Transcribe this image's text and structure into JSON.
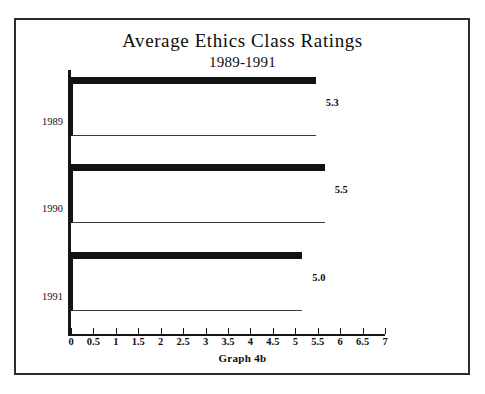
{
  "chart_data": {
    "type": "bar",
    "orientation": "horizontal",
    "title": "Average Ethics Class Ratings",
    "subtitle": "1989-1991",
    "caption": "Graph 4b",
    "categories": [
      "1989",
      "1990",
      "1991"
    ],
    "values": [
      5.3,
      5.5,
      5.0
    ],
    "value_labels": [
      "5.3",
      "5.5",
      "5.0"
    ],
    "xlabel": "",
    "ylabel": "",
    "xlim": [
      0,
      7
    ],
    "xtick_step": 0.5,
    "xticks": [
      "0",
      "0.5",
      "1",
      "1.5",
      "2",
      "2.5",
      "3",
      "3.5",
      "4",
      "4.5",
      "5",
      "5.5",
      "6",
      "6.5",
      "7"
    ],
    "grid": false,
    "legend": false,
    "series": [
      {
        "name": "Average Rating",
        "values": [
          5.3,
          5.5,
          5.0
        ]
      }
    ],
    "style": {
      "bar_fill": "#ffffff",
      "bar_edge": "#121212",
      "background": "#ffffff",
      "frame_color": "#2c2c2c",
      "text_color": "#101010"
    }
  }
}
